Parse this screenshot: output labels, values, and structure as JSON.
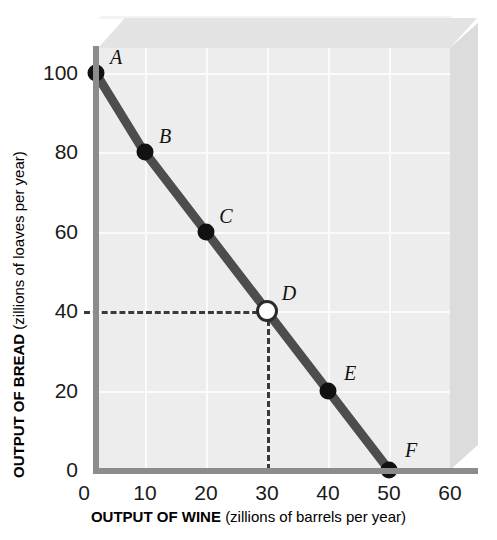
{
  "chart_data": {
    "type": "line",
    "title": "",
    "subtitle": "",
    "xlabel_bold": "OUTPUT OF WINE",
    "xlabel_rest": "(zillions of barrels per year)",
    "ylabel_bold": "OUTPUT OF BREAD",
    "ylabel_rest": "(zillions of loaves per year)",
    "xlim": [
      0,
      60
    ],
    "ylim": [
      0,
      100
    ],
    "xticks": [
      0,
      10,
      20,
      30,
      40,
      50,
      60
    ],
    "xtick_labels": [
      "0",
      "10",
      "20",
      "30",
      "40",
      "50",
      "60"
    ],
    "yticks": [
      0,
      20,
      40,
      60,
      80,
      100
    ],
    "ytick_labels": [
      "0",
      "20",
      "40",
      "60",
      "80",
      "100"
    ],
    "grid": true,
    "legend": "none",
    "series": [
      {
        "name": "Production possibilities frontier",
        "x": [
          2,
          10,
          20,
          30,
          40,
          50
        ],
        "y": [
          100,
          80,
          60,
          40,
          20,
          0
        ],
        "color": "#4d4d4d"
      }
    ],
    "points": [
      {
        "label": "A",
        "x": 2,
        "y": 100,
        "style": "filled",
        "label_dx": 20,
        "label_dy": -16
      },
      {
        "label": "B",
        "x": 10,
        "y": 80,
        "style": "filled",
        "label_dx": 20,
        "label_dy": -16
      },
      {
        "label": "C",
        "x": 20,
        "y": 60,
        "style": "filled",
        "label_dx": 20,
        "label_dy": -16
      },
      {
        "label": "D",
        "x": 30,
        "y": 40,
        "style": "hollow",
        "label_dx": 22,
        "label_dy": -18
      },
      {
        "label": "E",
        "x": 40,
        "y": 20,
        "style": "filled",
        "label_dx": 22,
        "label_dy": -18
      },
      {
        "label": "F",
        "x": 50,
        "y": 0,
        "style": "filled",
        "label_dx": 22,
        "label_dy": -20
      }
    ],
    "annotations": [
      {
        "kind": "dashed-horizontal",
        "y": 40,
        "from_x": 0,
        "to_x": 30
      },
      {
        "kind": "dashed-vertical",
        "x": 30,
        "from_y": 0,
        "to_y": 40
      }
    ],
    "colors": {
      "panel": "#ededed",
      "box_top": "#e3e3e3",
      "box_right": "#dcdcdc",
      "axis": "#8c8c8c",
      "curve": "#4d4d4d",
      "point": "#111111",
      "gridline": "#fbfbfb",
      "text": "#111111"
    }
  }
}
